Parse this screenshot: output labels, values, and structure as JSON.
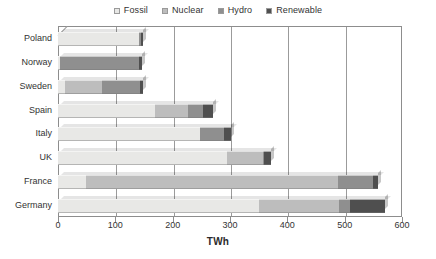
{
  "chart_data": {
    "type": "bar",
    "orientation": "horizontal",
    "stacked": true,
    "title": "",
    "xlabel": "TWh",
    "ylabel": "",
    "xlim": [
      0,
      600
    ],
    "xticks": [
      0,
      100,
      200,
      300,
      400,
      500,
      600
    ],
    "grid": true,
    "legend_position": "top",
    "categories": [
      "Poland",
      "Norway",
      "Sweden",
      "Spain",
      "Italy",
      "UK",
      "France",
      "Germany"
    ],
    "series": [
      {
        "name": "Fossil",
        "color": "#e8e8e6",
        "values": [
          142,
          3,
          12,
          170,
          248,
          295,
          48,
          350
        ]
      },
      {
        "name": "Nuclear",
        "color": "#bdbdbd",
        "values": [
          0,
          0,
          65,
          57,
          0,
          62,
          440,
          140
        ]
      },
      {
        "name": "Hydro",
        "color": "#8f8f8f",
        "values": [
          2,
          138,
          66,
          26,
          42,
          3,
          62,
          20
        ]
      },
      {
        "name": "Renewable",
        "color": "#4f4f4f",
        "values": [
          4,
          5,
          6,
          18,
          12,
          12,
          8,
          60
        ]
      }
    ],
    "totals": [
      148,
      146,
      149,
      271,
      302,
      372,
      558,
      570
    ],
    "units": "TWh"
  },
  "legend": {
    "items": [
      {
        "label": "Fossil",
        "swatch_name": "legend-swatch-fossil",
        "color": "#e8e8e6"
      },
      {
        "label": "Nuclear",
        "swatch_name": "legend-swatch-nuclear",
        "color": "#bdbdbd"
      },
      {
        "label": "Hydro",
        "swatch_name": "legend-swatch-hydro",
        "color": "#8f8f8f"
      },
      {
        "label": "Renewable",
        "swatch_name": "legend-swatch-renewable",
        "color": "#4f4f4f"
      }
    ]
  },
  "axis": {
    "x_title": "TWh",
    "x_tick_labels": [
      "0",
      "100",
      "200",
      "300",
      "400",
      "500",
      "600"
    ],
    "y_tick_labels": [
      "Poland",
      "Norway",
      "Sweden",
      "Spain",
      "Italy",
      "UK",
      "France",
      "Germany"
    ]
  }
}
